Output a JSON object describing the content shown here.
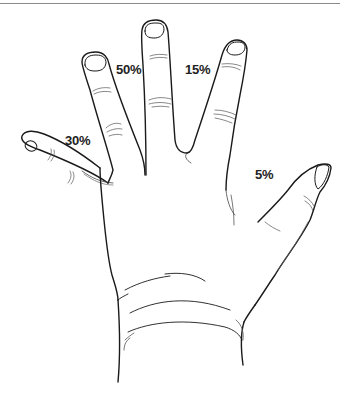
{
  "figure": {
    "stroke_color": "#1a1a1a",
    "label_color": "#222222",
    "labels": [
      {
        "finger": "pinky",
        "text": "30%",
        "x": 65,
        "y": 134
      },
      {
        "finger": "ring",
        "text": "50%",
        "x": 116,
        "y": 63
      },
      {
        "finger": "index",
        "text": "15%",
        "x": 185,
        "y": 63
      },
      {
        "finger": "thumb",
        "text": "5%",
        "x": 255,
        "y": 168
      }
    ]
  }
}
